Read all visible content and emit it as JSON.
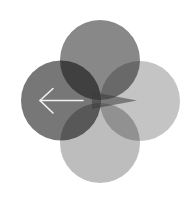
{
  "logo": {
    "name": "four-circle-back-arrow-logo",
    "background": "#ffffff",
    "circles": [
      {
        "position": "top",
        "cx": 100,
        "cy": 60,
        "r": 40,
        "color": "#888888"
      },
      {
        "position": "left",
        "cx": 61,
        "cy": 100.5,
        "r": 40,
        "color": "#777777"
      },
      {
        "position": "right",
        "cx": 140,
        "cy": 101,
        "r": 40,
        "color": "#c4c4c4"
      },
      {
        "position": "bottom",
        "cx": 100,
        "cy": 143,
        "r": 40,
        "color": "#bdbdbd"
      }
    ],
    "wedge": {
      "color": "#4a4a4a",
      "tip_x": 137,
      "tip_y": 100
    },
    "arrow": {
      "icon": "arrow-left-icon",
      "color": "#f2f2f2",
      "direction": "left"
    }
  }
}
